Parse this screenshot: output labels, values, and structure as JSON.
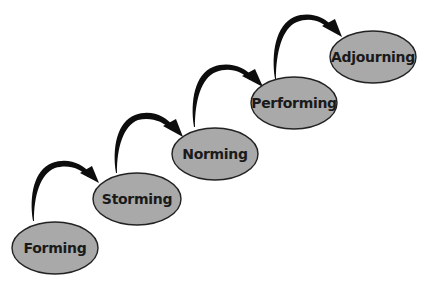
{
  "diagram": {
    "type": "process-flow",
    "colors": {
      "background": "#ffffff",
      "stage_fill": "#a9a9a9",
      "stage_stroke": "#222222",
      "arrow": "#0d0d0d",
      "text": "#1a1a1a"
    },
    "stages": [
      {
        "label": "Forming",
        "cx": 55,
        "cy": 248
      },
      {
        "label": "Storming",
        "cx": 137,
        "cy": 199
      },
      {
        "label": "Norming",
        "cx": 215,
        "cy": 154
      },
      {
        "label": "Performing",
        "cx": 294,
        "cy": 103
      },
      {
        "label": "Adjourning",
        "cx": 373,
        "cy": 57
      }
    ],
    "arrows": [
      {
        "from": "Forming",
        "to": "Storming"
      },
      {
        "from": "Storming",
        "to": "Norming"
      },
      {
        "from": "Norming",
        "to": "Performing"
      },
      {
        "from": "Performing",
        "to": "Adjourning"
      }
    ]
  }
}
